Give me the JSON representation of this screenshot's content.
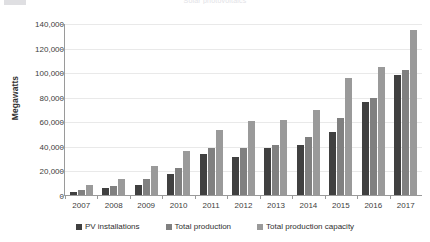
{
  "header": {
    "logo_placeholder": "",
    "clipped_title": "Solar photovoltaics"
  },
  "chart_data": {
    "type": "bar",
    "title": "",
    "xlabel": "",
    "ylabel": "Megawatts",
    "ylim": [
      0,
      140000
    ],
    "ytick_values": [
      0,
      20000,
      40000,
      60000,
      80000,
      100000,
      120000,
      140000
    ],
    "ytick_labels": [
      "0",
      "20,000",
      "40,000",
      "60,000",
      "80,000",
      "100,000",
      "120,000",
      "140,000"
    ],
    "categories": [
      "2007",
      "2008",
      "2009",
      "2010",
      "2011",
      "2012",
      "2013",
      "2014",
      "2015",
      "2016",
      "2017"
    ],
    "grid": true,
    "legend_position": "bottom",
    "series": [
      {
        "name": "PV installations",
        "color": "#404040",
        "values": [
          2500,
          6000,
          8000,
          17000,
          33000,
          31000,
          38000,
          41000,
          51000,
          76000,
          98000
        ]
      },
      {
        "name": "Total production",
        "color": "#808080",
        "values": [
          4000,
          7000,
          13000,
          22000,
          38000,
          38000,
          41000,
          47000,
          63000,
          79000,
          102000
        ]
      },
      {
        "name": "Total production capacity",
        "color": "#9a9a9a",
        "values": [
          8000,
          13000,
          24000,
          36000,
          53000,
          60000,
          61000,
          69000,
          95000,
          104000,
          134000
        ]
      }
    ]
  }
}
